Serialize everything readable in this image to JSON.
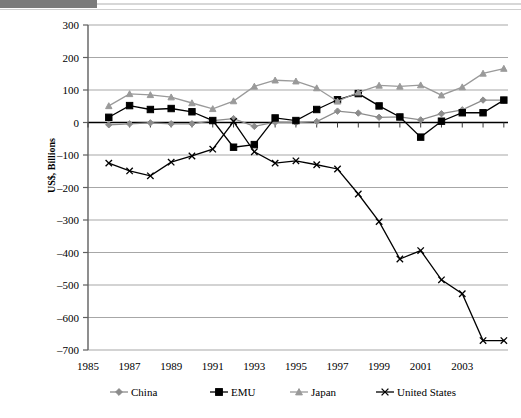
{
  "page": {
    "background_color": "#ffffff",
    "banner_color": "#7b7b7b",
    "banner_accent_color": "#d7d7d7"
  },
  "chart_data": {
    "type": "line",
    "title": "",
    "subtitle": "",
    "xlabel": "",
    "ylabel": "US$, Billions",
    "grid": true,
    "legend_position": "bottom",
    "xlim": [
      1985,
      2004
    ],
    "ylim": [
      -700,
      300
    ],
    "ytick_labels": [
      "300",
      "200",
      "100",
      "0",
      "-100",
      "-200",
      "-300",
      "-400",
      "-500",
      "-600",
      "-700"
    ],
    "ytick_values": [
      300,
      200,
      100,
      0,
      -100,
      -200,
      -300,
      -400,
      -500,
      -600,
      -700
    ],
    "xtick_labels": [
      "1985",
      "1987",
      "1989",
      "1991",
      "1993",
      "1995",
      "1997",
      "1999",
      "2001",
      "2003"
    ],
    "xtick_values": [
      1985,
      1987,
      1989,
      1991,
      1993,
      1995,
      1997,
      1999,
      2001,
      2003
    ],
    "x": [
      1986,
      1987,
      1988,
      1989,
      1990,
      1991,
      1992,
      1993,
      1994,
      1995,
      1996,
      1997,
      1998,
      1999,
      2000,
      2001,
      2002,
      2003,
      2004
    ],
    "series": [
      {
        "name": "China",
        "color": "#8c8c8c",
        "marker": "diamond",
        "values": [
          -7,
          -4,
          -1,
          -4,
          -4,
          6,
          12,
          -12,
          1,
          0,
          3,
          35,
          29,
          16,
          17,
          8,
          27,
          39,
          69
        ]
      },
      {
        "name": "EMU",
        "color": "#000000",
        "marker": "square",
        "values": [
          16,
          52,
          40,
          43,
          33,
          6,
          -76,
          -68,
          14,
          6,
          40,
          70,
          89,
          51,
          17,
          -45,
          4,
          30,
          30
        ]
      },
      {
        "name": "Japan",
        "color": "#9a9a9a",
        "marker": "triangle",
        "values": [
          51,
          88,
          85,
          78,
          60,
          42,
          66,
          111,
          130,
          127,
          106,
          65,
          93,
          114,
          111,
          115,
          84,
          109,
          151
        ]
      },
      {
        "name": "United States",
        "color": "#000000",
        "marker": "x",
        "values": [
          -125,
          -149,
          -164,
          -122,
          -103,
          -82,
          3,
          -90,
          -125,
          -118,
          -130,
          -143,
          -220,
          -305,
          -420,
          -394,
          -484,
          -527,
          -671
        ]
      }
    ],
    "series_extra_points": {
      "China": [
        {
          "x": 2005,
          "y": 69
        }
      ],
      "EMU": [
        {
          "x": 2005,
          "y": 69
        }
      ],
      "Japan": [
        {
          "x": 2005,
          "y": 166
        }
      ],
      "United States": [
        {
          "x": 2005,
          "y": -671
        }
      ]
    }
  },
  "legend": {
    "items": [
      {
        "label": "China",
        "color": "#8c8c8c",
        "marker": "diamond"
      },
      {
        "label": "EMU",
        "color": "#000000",
        "marker": "square"
      },
      {
        "label": "Japan",
        "color": "#9a9a9a",
        "marker": "triangle"
      },
      {
        "label": "United States",
        "color": "#000000",
        "marker": "x"
      }
    ]
  }
}
